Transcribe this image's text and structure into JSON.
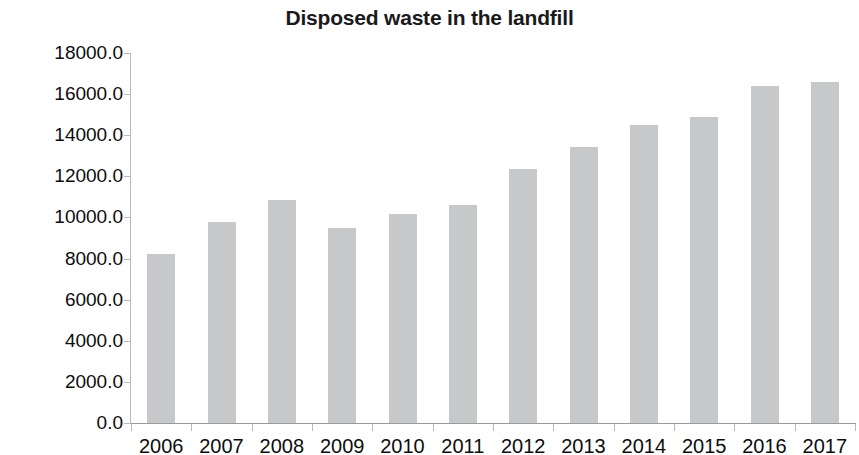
{
  "chart_data": {
    "type": "bar",
    "title": "Disposed waste in the landfill",
    "xlabel": "",
    "ylabel": "Waste disposed in Tons",
    "categories": [
      "2006",
      "2007",
      "2008",
      "2009",
      "2010",
      "2011",
      "2012",
      "2013",
      "2014",
      "2015",
      "2016",
      "2017"
    ],
    "values": [
      8200,
      9800,
      10850,
      9500,
      10150,
      10600,
      12350,
      13450,
      14500,
      14900,
      16400,
      16600
    ],
    "ylim": [
      0,
      18000
    ],
    "ytick_labels": [
      "0.0",
      "2000.0",
      "4000.0",
      "6000.0",
      "8000.0",
      "10000.0",
      "12000.0",
      "14000.0",
      "16000.0",
      "18000.0"
    ],
    "yticks": [
      0,
      2000,
      4000,
      6000,
      8000,
      10000,
      12000,
      14000,
      16000,
      18000
    ],
    "grid": false,
    "legend": null,
    "bar_color": "#c6c8ca",
    "axis_color": "#b9b9b9",
    "text_color": "#0d0d0d"
  }
}
